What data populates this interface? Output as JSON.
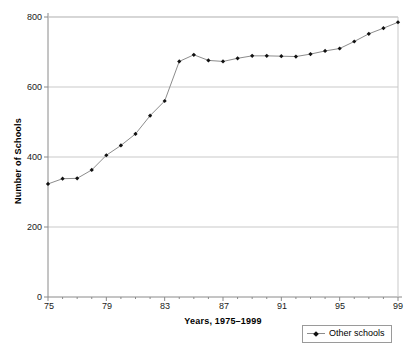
{
  "chart_data": {
    "type": "line",
    "title": "",
    "xlabel": "Years, 1975–1999",
    "ylabel": "Number of Schools",
    "xlim": [
      1975,
      1999
    ],
    "ylim": [
      0,
      800
    ],
    "grid": true,
    "legend_position": "bottom-right",
    "x_tick_labels": [
      "75",
      "79",
      "83",
      "87",
      "91",
      "95",
      "99"
    ],
    "x_tick_values": [
      1975,
      1979,
      1983,
      1987,
      1991,
      1995,
      1999
    ],
    "y_tick_labels": [
      "0",
      "200",
      "400",
      "600",
      "800"
    ],
    "y_tick_values": [
      0,
      200,
      400,
      600,
      800
    ],
    "x": [
      1975,
      1976,
      1977,
      1978,
      1979,
      1980,
      1981,
      1982,
      1983,
      1984,
      1985,
      1986,
      1987,
      1988,
      1989,
      1990,
      1991,
      1992,
      1993,
      1994,
      1995,
      1996,
      1997,
      1998,
      1999
    ],
    "series": [
      {
        "name": "Other schools",
        "marker": "diamond",
        "color": "#111111",
        "line_color": "#8c8c8c",
        "values": [
          323,
          338,
          339,
          363,
          405,
          433,
          466,
          518,
          560,
          673,
          692,
          676,
          673,
          682,
          689,
          689,
          688,
          687,
          694,
          703,
          710,
          730,
          752,
          768,
          785
        ]
      }
    ]
  },
  "legend": {
    "entries": [
      {
        "label": "Other schools"
      }
    ]
  },
  "axes": {
    "y_title": "Number of Schools",
    "x_title": "Years, 1975–1999"
  }
}
